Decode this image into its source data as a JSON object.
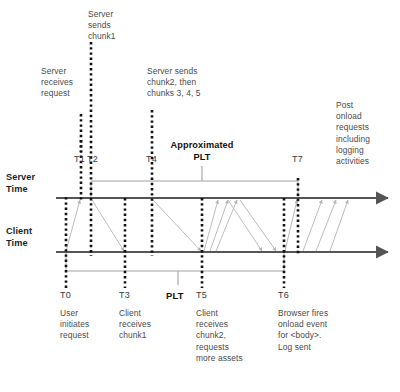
{
  "diagram": {
    "colors": {
      "axis": "#555555",
      "marker": "#111111",
      "transfer": "#b0b0b0",
      "span": "#bdbdbd",
      "text": "#4a4a4a",
      "bold_text": "#111111"
    },
    "axes": [
      {
        "id": "server",
        "label": "Server\nTime",
        "y": 198
      },
      {
        "id": "client",
        "label": "Client\nTime",
        "y": 252
      }
    ],
    "markers": [
      {
        "id": "T0",
        "label": "T0",
        "x": 66,
        "lane": "client"
      },
      {
        "id": "T1",
        "label": "T1",
        "x": 81,
        "lane": "server"
      },
      {
        "id": "T2",
        "label": "T2",
        "x": 91,
        "lane": "server"
      },
      {
        "id": "T3",
        "label": "T3",
        "x": 125,
        "lane": "client"
      },
      {
        "id": "T4",
        "label": "T4",
        "x": 152,
        "lane": "server"
      },
      {
        "id": "T5",
        "label": "T5",
        "x": 202,
        "lane": "client"
      },
      {
        "id": "T6",
        "label": "T6",
        "x": 284,
        "lane": "client"
      },
      {
        "id": "T7",
        "label": "T7",
        "x": 298,
        "lane": "server"
      }
    ],
    "top_notes": [
      {
        "id": "server-receives",
        "text": "Server\nreceives\nrequest"
      },
      {
        "id": "server-sends-chunk1",
        "text": "Server\nsends\nchunk1"
      },
      {
        "id": "server-sends-chunk2",
        "text": "Server sends\nchunk2, then\nchunks 3, 4, 5"
      },
      {
        "id": "post-onload",
        "text": "Post\nonload\nrequests\nincluding\nlogging\nactivities"
      }
    ],
    "bottom_notes": [
      {
        "id": "user-initiates",
        "text": "User\ninitiates\nrequest"
      },
      {
        "id": "client-receives-chunk1",
        "text": "Client\nreceives\nchunk1"
      },
      {
        "id": "client-receives-chunk2",
        "text": "Client\nreceives\nchunk2,\nrequests\nmore assets"
      },
      {
        "id": "browser-onload",
        "text": "Browser fires\nonload event\nfor <body>.\nLog sent"
      }
    ],
    "plt": {
      "approximated_label": "Approximated\nPLT",
      "actual_label": "PLT",
      "server_span": {
        "from": "T2",
        "to": "T7"
      },
      "client_span": {
        "from": "T0",
        "to": "T6"
      }
    }
  }
}
